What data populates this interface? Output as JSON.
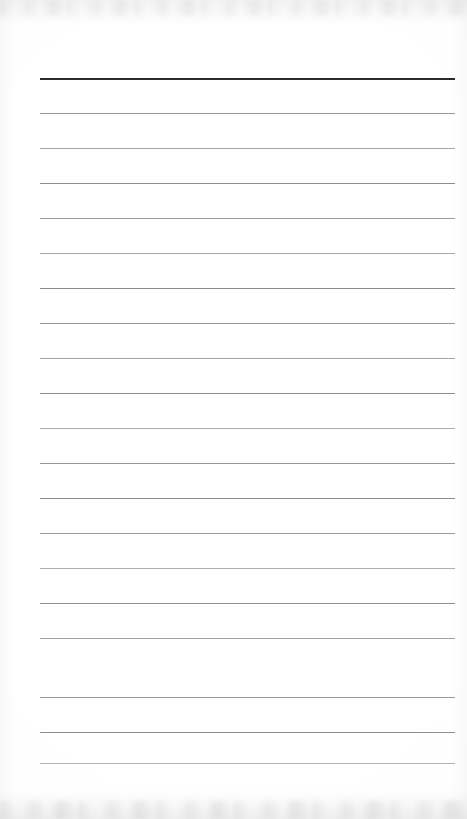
{
  "document": {
    "kind": "scanned-lined-page",
    "orientation": "portrait",
    "page_width_px": 467,
    "page_height_px": 819,
    "background_color": "#ffffff",
    "visible_text": "",
    "text_content_present": false
  },
  "ruling": {
    "line_count": 20,
    "left_x_px": 40,
    "right_x_px": 455,
    "first_line_y_px": 78,
    "line_spacing_px": 35,
    "header_rule_color": "#2b2b2b",
    "header_rule_thickness_px": 2,
    "body_rule_color": "#8a8a8e",
    "body_rule_thickness_px": 1,
    "lines": [
      {
        "index": 1,
        "y": 78,
        "color": "#2b2b2b",
        "thickness": 2,
        "opacity": 1.0,
        "emphasis": "header"
      },
      {
        "index": 2,
        "y": 113,
        "color": "#8e8e92",
        "thickness": 1,
        "opacity": 0.92,
        "emphasis": "body"
      },
      {
        "index": 3,
        "y": 148,
        "color": "#96969a",
        "thickness": 1,
        "opacity": 0.86,
        "emphasis": "body"
      },
      {
        "index": 4,
        "y": 183,
        "color": "#87878b",
        "thickness": 1,
        "opacity": 0.94,
        "emphasis": "body"
      },
      {
        "index": 5,
        "y": 218,
        "color": "#909094",
        "thickness": 1,
        "opacity": 0.88,
        "emphasis": "body"
      },
      {
        "index": 6,
        "y": 253,
        "color": "#99999d",
        "thickness": 1,
        "opacity": 0.84,
        "emphasis": "body"
      },
      {
        "index": 7,
        "y": 288,
        "color": "#84848a",
        "thickness": 1.2,
        "opacity": 0.96,
        "emphasis": "body"
      },
      {
        "index": 8,
        "y": 323,
        "color": "#8c8c90",
        "thickness": 1,
        "opacity": 0.9,
        "emphasis": "body"
      },
      {
        "index": 9,
        "y": 358,
        "color": "#949498",
        "thickness": 1,
        "opacity": 0.86,
        "emphasis": "body"
      },
      {
        "index": 10,
        "y": 393,
        "color": "#86868c",
        "thickness": 1.2,
        "opacity": 0.95,
        "emphasis": "body"
      },
      {
        "index": 11,
        "y": 428,
        "color": "#9a9a9e",
        "thickness": 1,
        "opacity": 0.82,
        "emphasis": "body"
      },
      {
        "index": 12,
        "y": 463,
        "color": "#8b8b8f",
        "thickness": 1,
        "opacity": 0.91,
        "emphasis": "body"
      },
      {
        "index": 13,
        "y": 498,
        "color": "#858589",
        "thickness": 1.2,
        "opacity": 0.95,
        "emphasis": "body"
      },
      {
        "index": 14,
        "y": 533,
        "color": "#8f8f93",
        "thickness": 1,
        "opacity": 0.89,
        "emphasis": "body"
      },
      {
        "index": 15,
        "y": 568,
        "color": "#9b9b9f",
        "thickness": 1,
        "opacity": 0.81,
        "emphasis": "body"
      },
      {
        "index": 16,
        "y": 603,
        "color": "#888890",
        "thickness": 1,
        "opacity": 0.93,
        "emphasis": "body"
      },
      {
        "index": 17,
        "y": 638,
        "color": "#929296",
        "thickness": 1,
        "opacity": 0.87,
        "emphasis": "body"
      },
      {
        "index": 18,
        "y": 697,
        "color": "#8d8d91",
        "thickness": 1,
        "opacity": 0.9,
        "emphasis": "body"
      },
      {
        "index": 19,
        "y": 732,
        "color": "#87878d",
        "thickness": 1,
        "opacity": 0.93,
        "emphasis": "body"
      },
      {
        "index": 20,
        "y": 763,
        "color": "#9c9ca0",
        "thickness": 1.3,
        "opacity": 0.8,
        "emphasis": "body"
      }
    ]
  },
  "artifacts": {
    "top_edge_noise": "faint-gray-scan-band",
    "bottom_edge_noise": "faint-gray-scan-band",
    "left_edge_shading": "soft-gradient",
    "right_edge_shading": "soft-gradient"
  }
}
